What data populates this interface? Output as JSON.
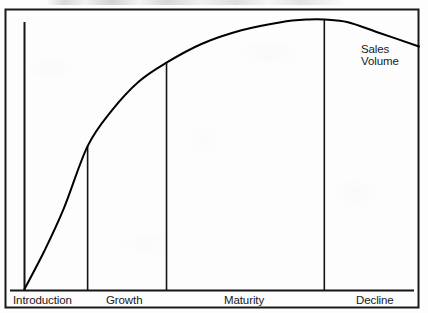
{
  "chart_data": {
    "type": "line",
    "title": "",
    "subtitle": "",
    "xlabel": "",
    "ylabel": "",
    "grid": false,
    "legend_position": "inline-right",
    "axes": {
      "x_axis_visible": true,
      "y_axis_visible": true,
      "x_ticks": [],
      "y_ticks": [],
      "xlim": [
        0,
        100
      ],
      "ylim": [
        0,
        100
      ]
    },
    "annotations": [
      {
        "name": "series-label",
        "text_lines": [
          "Sales",
          "Volume"
        ],
        "x": 86,
        "y": 86
      }
    ],
    "categories": [
      "Introduction",
      "Growth",
      "Maturity",
      "Decline"
    ],
    "stage_boundaries_pct": [
      0,
      16,
      36,
      76,
      100
    ],
    "series": [
      {
        "name": "Sales Volume",
        "color": "#000000",
        "points": [
          {
            "x": 0,
            "y": 0
          },
          {
            "x": 5,
            "y": 14
          },
          {
            "x": 10,
            "y": 30
          },
          {
            "x": 16,
            "y": 53
          },
          {
            "x": 22,
            "y": 66
          },
          {
            "x": 29,
            "y": 77
          },
          {
            "x": 36,
            "y": 84
          },
          {
            "x": 45,
            "y": 91
          },
          {
            "x": 55,
            "y": 96
          },
          {
            "x": 65,
            "y": 99
          },
          {
            "x": 72,
            "y": 100
          },
          {
            "x": 76,
            "y": 100
          },
          {
            "x": 82,
            "y": 99
          },
          {
            "x": 90,
            "y": 95
          },
          {
            "x": 100,
            "y": 90
          }
        ]
      }
    ],
    "divider_lines": [
      {
        "label": "introduction-growth",
        "x_pct": 16,
        "top_y_pct": 53
      },
      {
        "label": "growth-maturity",
        "x_pct": 36,
        "top_y_pct": 84
      },
      {
        "label": "maturity-decline",
        "x_pct": 76,
        "top_y_pct": 100
      }
    ]
  },
  "figure": {
    "border_color": "#1a1a1a",
    "line_color": "#000000",
    "background": "#fdfdfd"
  },
  "labels": {
    "stage_1": "Introduction",
    "stage_2": "Growth",
    "stage_3": "Maturity",
    "stage_4": "Decline",
    "series_line_1": "Sales",
    "series_line_2": "Volume"
  }
}
